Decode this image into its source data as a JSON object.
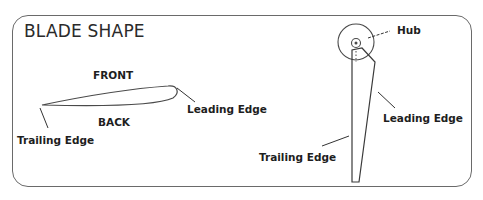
{
  "diagram": {
    "title": "BLADE SHAPE",
    "airfoil": {
      "front_label": "FRONT",
      "back_label": "BACK",
      "leading_edge_label": "Leading Edge",
      "trailing_edge_label": "Trailing Edge"
    },
    "blade": {
      "hub_label": "Hub",
      "leading_edge_label": "Leading Edge",
      "trailing_edge_label": "Trailing Edge"
    },
    "colors": {
      "stroke": "#333333",
      "border": "#6a6a6a",
      "text": "#1e1e1e"
    }
  }
}
